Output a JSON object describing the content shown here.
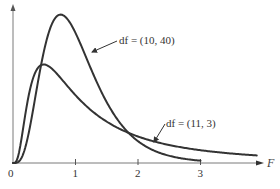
{
  "chart_data": {
    "type": "line",
    "title": "",
    "xlabel": "F",
    "ylabel": "",
    "xlim": [
      0,
      4.0
    ],
    "ylim": [
      0,
      0.85
    ],
    "grid": false,
    "x_ticks": [
      "0",
      "1",
      "2",
      "3"
    ],
    "x_tick_values": [
      0,
      1,
      2,
      3
    ],
    "series": [
      {
        "name": "df = (10, 40)",
        "df1": 10,
        "df2": 40,
        "x_end": 3.0,
        "peak": {
          "x": 0.8,
          "y": 0.82
        }
      },
      {
        "name": "df = (11, 3)",
        "df1": 11,
        "df2": 3,
        "x_end": 3.9,
        "peak": {
          "x": 0.4,
          "y": 0.51
        }
      }
    ],
    "annotations": [
      {
        "text": "df = (10, 40)",
        "points_to": "df = (10, 40)"
      },
      {
        "text": "df = (11, 3)",
        "points_to": "df = (11, 3)"
      }
    ]
  }
}
